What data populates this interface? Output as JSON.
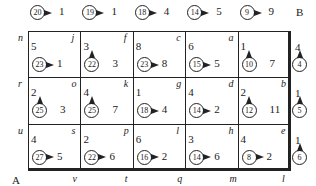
{
  "corners": {
    "B": "B",
    "A": "A"
  },
  "top_clues": [
    {
      "circle": "20",
      "value": "1"
    },
    {
      "circle": "19",
      "value": "1"
    },
    {
      "circle": "18",
      "value": "4"
    },
    {
      "circle": "14",
      "value": "5"
    },
    {
      "circle": "9",
      "value": "9"
    }
  ],
  "right_clues": [
    {
      "top": "4",
      "circle": "4"
    },
    {
      "top": "1",
      "circle": "5"
    },
    {
      "top": "1",
      "circle": "6"
    }
  ],
  "left_labels": [
    "n",
    "r",
    "u"
  ],
  "bottom_labels": [
    "v",
    "t",
    "q",
    "m",
    "l"
  ],
  "rows": [
    [
      {
        "corner": "j",
        "num": "5",
        "circle": "23",
        "dir": "right",
        "value": "1"
      },
      {
        "corner": "f",
        "num": "3",
        "circle": "22",
        "dir": "up",
        "value": "3"
      },
      {
        "corner": "c",
        "num": "8",
        "circle": "23",
        "dir": "right",
        "value": "8"
      },
      {
        "corner": "a",
        "num": "6",
        "circle": "15",
        "dir": "right",
        "value": "5"
      },
      {
        "corner": "",
        "num": "1",
        "circle": "10",
        "dir": "up",
        "value": "7"
      }
    ],
    [
      {
        "corner": "o",
        "num": "2",
        "circle": "25",
        "dir": "up",
        "value": "3"
      },
      {
        "corner": "k",
        "num": "4",
        "circle": "25",
        "dir": "up",
        "value": "7"
      },
      {
        "corner": "g",
        "num": "1",
        "circle": "18",
        "dir": "right",
        "value": "4"
      },
      {
        "corner": "d",
        "num": "4",
        "circle": "14",
        "dir": "right",
        "value": "2"
      },
      {
        "corner": "b",
        "num": "2",
        "circle": "12",
        "dir": "up",
        "value": "11"
      }
    ],
    [
      {
        "corner": "s",
        "num": "4",
        "circle": "27",
        "dir": "right",
        "value": "5"
      },
      {
        "corner": "p",
        "num": "2",
        "circle": "22",
        "dir": "right",
        "value": "6"
      },
      {
        "corner": "l",
        "num": "6",
        "circle": "16",
        "dir": "right",
        "value": "2"
      },
      {
        "corner": "h",
        "num": "3",
        "circle": "14",
        "dir": "right",
        "value": "6"
      },
      {
        "corner": "e",
        "num": "4",
        "circle": "8",
        "dir": "right",
        "value": "2"
      }
    ]
  ]
}
